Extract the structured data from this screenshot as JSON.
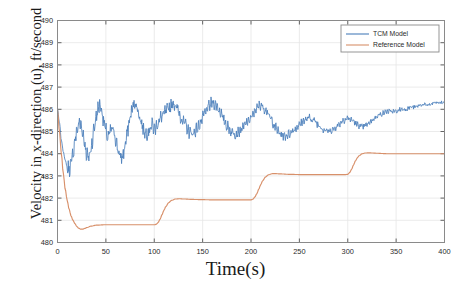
{
  "chart_data": {
    "type": "line",
    "title": "",
    "xlabel": "Time(s)",
    "ylabel": "Velocity in x-direction (u), ft/second",
    "xlim": [
      0,
      400
    ],
    "ylim": [
      480,
      490
    ],
    "xticks": [
      0,
      50,
      100,
      150,
      200,
      250,
      300,
      350,
      400
    ],
    "xticklabels": [
      "0",
      "50",
      "100",
      "150",
      "200",
      "250",
      "300",
      "350",
      "400"
    ],
    "yticks": [
      480,
      481,
      482,
      483,
      484,
      485,
      486,
      487,
      488,
      489,
      490
    ],
    "yticklabels": [
      "480",
      "481",
      "482",
      "483",
      "484",
      "485",
      "486",
      "487",
      "488",
      "489",
      "490"
    ],
    "grid": true,
    "legend_position": "upper right",
    "series": [
      {
        "name": "TCM Model",
        "color": "#4a7ebb",
        "x": [
          0,
          2,
          4,
          6,
          8,
          10,
          12,
          14,
          16,
          18,
          20,
          22,
          24,
          26,
          28,
          30,
          32,
          34,
          36,
          38,
          40,
          42,
          44,
          46,
          48,
          50,
          52,
          54,
          56,
          58,
          60,
          62,
          64,
          66,
          68,
          70,
          72,
          74,
          76,
          78,
          80,
          82,
          84,
          86,
          88,
          90,
          92,
          94,
          96,
          98,
          100,
          104,
          108,
          112,
          116,
          120,
          124,
          128,
          132,
          136,
          140,
          144,
          148,
          152,
          156,
          160,
          164,
          168,
          172,
          176,
          180,
          184,
          188,
          192,
          196,
          200,
          205,
          210,
          215,
          220,
          225,
          230,
          235,
          240,
          245,
          250,
          255,
          260,
          265,
          270,
          275,
          280,
          285,
          290,
          295,
          300,
          305,
          310,
          315,
          320,
          325,
          330,
          335,
          340,
          345,
          350,
          355,
          360,
          365,
          370,
          375,
          380,
          385,
          390,
          395,
          400
        ],
        "y": [
          486.0,
          485.4,
          484.6,
          484.1,
          483.7,
          483.4,
          483.3,
          483.5,
          484.0,
          484.6,
          485.0,
          485.4,
          485.3,
          485.0,
          484.5,
          484.0,
          483.8,
          484.1,
          484.6,
          485.2,
          485.7,
          486.0,
          486.2,
          485.9,
          485.4,
          485.0,
          484.7,
          484.9,
          485.1,
          485.0,
          484.7,
          484.3,
          483.9,
          483.8,
          484.0,
          484.4,
          484.9,
          485.4,
          485.8,
          486.1,
          486.3,
          486.1,
          485.8,
          485.5,
          485.2,
          485.0,
          484.9,
          485.0,
          485.2,
          485.3,
          485.1,
          485.4,
          485.7,
          485.9,
          486.1,
          486.3,
          486.0,
          485.6,
          485.3,
          485.0,
          484.9,
          485.1,
          485.4,
          485.8,
          486.1,
          486.3,
          486.2,
          485.9,
          485.5,
          485.2,
          485.0,
          484.9,
          485.0,
          485.2,
          485.4,
          485.6,
          486.0,
          486.2,
          486.0,
          485.6,
          485.2,
          484.9,
          484.8,
          484.9,
          485.1,
          485.3,
          485.5,
          485.6,
          485.5,
          485.3,
          485.1,
          485.0,
          485.1,
          485.3,
          485.5,
          485.6,
          485.5,
          485.3,
          485.2,
          485.3,
          485.5,
          485.7,
          485.8,
          485.9,
          485.9,
          485.9,
          486.0,
          486.0,
          486.1,
          486.1,
          486.2,
          486.2,
          486.2,
          486.3,
          486.3,
          486.3
        ]
      },
      {
        "name": "Reference Model",
        "color": "#d8906a",
        "x": [
          0,
          2,
          4,
          6,
          8,
          10,
          12,
          14,
          16,
          18,
          20,
          22,
          24,
          26,
          28,
          30,
          35,
          40,
          50,
          60,
          70,
          80,
          90,
          98,
          100,
          102,
          104,
          106,
          108,
          110,
          112,
          115,
          118,
          122,
          126,
          130,
          140,
          150,
          160,
          170,
          180,
          190,
          198,
          200,
          202,
          204,
          206,
          208,
          210,
          212,
          215,
          218,
          222,
          226,
          230,
          240,
          250,
          260,
          270,
          280,
          290,
          298,
          300,
          302,
          304,
          306,
          308,
          310,
          312,
          315,
          318,
          322,
          326,
          330,
          340,
          350,
          360,
          370,
          380,
          390,
          400
        ],
        "y": [
          486.0,
          485.0,
          484.0,
          483.1,
          482.4,
          481.9,
          481.5,
          481.2,
          481.0,
          480.85,
          480.72,
          480.64,
          480.6,
          480.6,
          480.63,
          480.67,
          480.74,
          480.78,
          480.8,
          480.8,
          480.8,
          480.8,
          480.8,
          480.8,
          480.8,
          480.82,
          480.9,
          481.05,
          481.25,
          481.45,
          481.62,
          481.8,
          481.9,
          481.96,
          481.97,
          481.96,
          481.94,
          481.93,
          481.92,
          481.92,
          481.92,
          481.92,
          481.92,
          481.92,
          481.95,
          482.05,
          482.2,
          482.4,
          482.6,
          482.78,
          482.95,
          483.05,
          483.1,
          483.1,
          483.09,
          483.07,
          483.06,
          483.06,
          483.06,
          483.06,
          483.06,
          483.06,
          483.07,
          483.15,
          483.3,
          483.5,
          483.68,
          483.82,
          483.92,
          484.0,
          484.03,
          484.04,
          484.03,
          484.02,
          484.0,
          484.0,
          484.0,
          484.0,
          484.0,
          484.0,
          484.0
        ]
      }
    ],
    "legend": [
      "TCM Model",
      "Reference Model"
    ]
  },
  "axes": {
    "x_title": "Time(s)",
    "y_title": "Velocity in x-direction (u), ft/second"
  },
  "legend": {
    "items": [
      {
        "label": "TCM Model",
        "color": "#4a7ebb"
      },
      {
        "label": "Reference Model",
        "color": "#d8906a"
      }
    ]
  }
}
